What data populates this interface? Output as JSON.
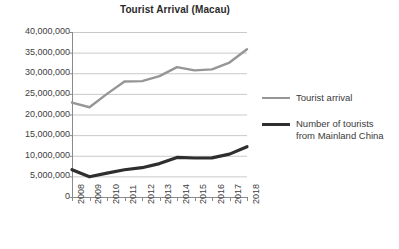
{
  "chart_data": {
    "type": "line",
    "title": "Tourist Arrival (Macau)",
    "xlabel": "",
    "ylabel": "",
    "x": [
      "2008",
      "2009",
      "2010",
      "2011",
      "2012",
      "2013",
      "2014",
      "2015",
      "2016",
      "2017",
      "2018"
    ],
    "categories": [
      "2008",
      "2009",
      "2010",
      "2011",
      "2012",
      "2013",
      "2014",
      "2015",
      "2016",
      "2017",
      "2018"
    ],
    "ylim": [
      0,
      40000000
    ],
    "ytick_values": [
      0,
      5000000,
      10000000,
      15000000,
      20000000,
      25000000,
      30000000,
      35000000,
      40000000
    ],
    "ytick_labels": [
      "0",
      "5,000,000",
      "10,000,000",
      "15,000,000",
      "20,000,000",
      "25,000,000",
      "30,000,000",
      "35,000,000",
      "40,000,000"
    ],
    "grid": true,
    "legend_position": "right",
    "series": [
      {
        "name": "Tourist arrival",
        "color": "#969696",
        "width": 2.4,
        "values": [
          22900000,
          21750000,
          25000000,
          28000000,
          28100000,
          29300000,
          31500000,
          30700000,
          30950000,
          32600000,
          35800000
        ]
      },
      {
        "name": "Number of tourists from Mainland China",
        "color": "#2e2e2e",
        "width": 3.2,
        "values": [
          6620000,
          4900000,
          5800000,
          6600000,
          7100000,
          8100000,
          9600000,
          9450000,
          9500000,
          10400000,
          12200000
        ]
      }
    ]
  },
  "legend": {
    "entries": [
      {
        "label": "Tourist arrival",
        "label2": ""
      },
      {
        "label": "Number of tourists",
        "label2": "from Mainland China"
      }
    ]
  },
  "colors": {
    "series_light": "#969696",
    "series_dark": "#2e2e2e",
    "grid": "#c9c9c9",
    "axis": "#8a8a8a",
    "text": "#3a3a3a"
  }
}
